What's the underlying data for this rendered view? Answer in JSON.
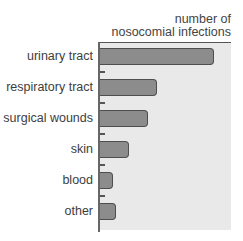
{
  "chart_data": {
    "type": "bar",
    "orientation": "horizontal",
    "title": "number of nosocomial infections",
    "title_lines": [
      "number of",
      "nosocomial infections"
    ],
    "xlabel": "number of nosocomial infections",
    "ylabel": "",
    "categories": [
      "urinary tract",
      "respiratory tract",
      "surgical wounds",
      "skin",
      "blood",
      "other"
    ],
    "values": [
      100,
      50,
      42,
      25,
      11,
      13
    ],
    "value_units": "relative (no numeric axis shown)",
    "xlim": [
      0,
      116
    ],
    "grid": false,
    "legend": null,
    "colors": {
      "bar_fill": "#8c8c8c",
      "bar_outline": "#4e4e4e",
      "panel": "#e9e9e9",
      "axis": "#555555"
    }
  },
  "layout": {
    "bar_px_per_unit": 1.13,
    "row_tops": [
      48,
      79,
      110,
      141,
      172,
      203
    ],
    "tick_tops": [
      71,
      102,
      133,
      164,
      195
    ]
  }
}
